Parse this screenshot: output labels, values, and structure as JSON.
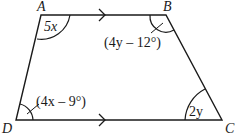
{
  "figure": {
    "type": "trapezoid",
    "stroke_color": "#1a1a1a",
    "background": "#ffffff"
  },
  "vertices": {
    "A": {
      "label": "A",
      "x": 41,
      "y": 15
    },
    "B": {
      "label": "B",
      "x": 166,
      "y": 15
    },
    "C": {
      "label": "C",
      "x": 222,
      "y": 120
    },
    "D": {
      "label": "D",
      "x": 16,
      "y": 120
    }
  },
  "angles": {
    "A": {
      "label": "5x"
    },
    "B": {
      "label": "(4y – 12°)"
    },
    "C": {
      "label": "2y"
    },
    "D": {
      "label": "(4x – 9°)"
    }
  },
  "parallel_marks": {
    "top": {
      "side": "AB",
      "symbol": "arrow-right"
    },
    "bottom": {
      "side": "DC",
      "symbol": "arrow-right"
    }
  }
}
